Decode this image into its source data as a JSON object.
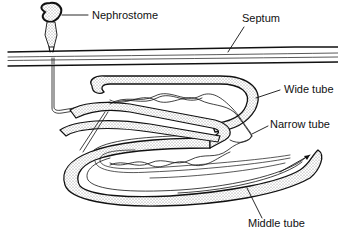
{
  "diagram": {
    "type": "anatomical line drawing",
    "labels": {
      "nephrostome": "Nephrostome",
      "septum": "Septum",
      "wide_tube": "Wide tube",
      "narrow_tube": "Narrow tube",
      "middle_tube": "Middle tube"
    },
    "colors": {
      "line": "#111111",
      "stipple": "#9a9a9a",
      "background": "#ffffff"
    }
  }
}
